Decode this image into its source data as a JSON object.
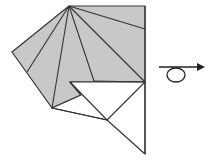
{
  "diagram": {
    "type": "origami-fold-step",
    "paper_color": "#c8c8c8",
    "back_color": "#ffffff",
    "line_color": "#333333",
    "symbol": "turn-over-icon"
  }
}
